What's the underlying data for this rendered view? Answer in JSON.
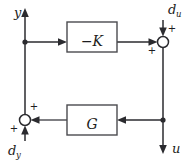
{
  "diagram": {
    "type": "control-block-diagram",
    "background_color": "#ffffff",
    "line_color": "#2b2b2f",
    "block_border_color": "#4a4a4f",
    "blocks": [
      {
        "id": "controller",
        "label": "−K",
        "x": 67,
        "y": 22,
        "width": 50,
        "height": 30
      },
      {
        "id": "plant",
        "label": "G",
        "x": 67,
        "y": 105,
        "width": 50,
        "height": 30
      }
    ],
    "summing_junctions": [
      {
        "id": "input-sum",
        "cx": 163,
        "cy": 42,
        "r": 5.5,
        "signs": [
          {
            "text": "+",
            "x": 172,
            "y": 32
          },
          {
            "text": "+",
            "x": 152,
            "y": 54
          }
        ]
      },
      {
        "id": "output-sum",
        "cx": 25,
        "cy": 120,
        "r": 5.5,
        "signs": [
          {
            "text": "+",
            "x": 34,
            "y": 110
          },
          {
            "text": "+",
            "x": 14,
            "y": 132
          }
        ]
      }
    ],
    "signals": [
      {
        "id": "output-y",
        "label": "y",
        "subscript": "",
        "x": 14,
        "y": 17
      },
      {
        "id": "input-du",
        "label": "d",
        "subscript": "u",
        "x": 168,
        "y": 14
      },
      {
        "id": "output-u",
        "label": "u",
        "subscript": "",
        "x": 172,
        "y": 153
      },
      {
        "id": "input-dy",
        "label": "d",
        "subscript": "y",
        "x": 8,
        "y": 155
      }
    ],
    "node_dots": [
      {
        "id": "measurement-tap",
        "cx": 25,
        "cy": 42
      },
      {
        "id": "actuation-tap",
        "cx": 163,
        "cy": 120
      }
    ]
  }
}
